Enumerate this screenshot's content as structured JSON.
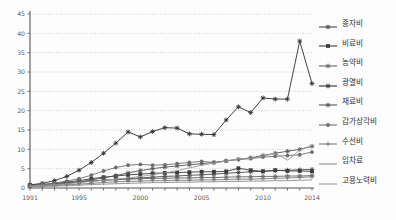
{
  "chart_data": {
    "type": "line",
    "title": "",
    "xlabel": "",
    "ylabel": "",
    "ylim": [
      0,
      45
    ],
    "xlim": [
      1991,
      2014
    ],
    "grid": true,
    "legend_position": "right",
    "y_ticks": [
      0,
      5,
      10,
      15,
      20,
      25,
      30,
      35,
      40,
      45
    ],
    "x_ticks": [
      1991,
      1995,
      2000,
      2005,
      2010,
      2014
    ],
    "x": [
      1991,
      1992,
      1993,
      1994,
      1995,
      1996,
      1997,
      1998,
      1999,
      2000,
      2001,
      2002,
      2003,
      2004,
      2005,
      2006,
      2007,
      2008,
      2009,
      2010,
      2011,
      2012,
      2013,
      2014
    ],
    "series": [
      {
        "name": "종자비",
        "marker": "plus-star",
        "color": "#4a4a4a",
        "values": [
          0.7,
          0.9,
          1.1,
          1.3,
          1.5,
          1.8,
          2.0,
          2.2,
          2.4,
          2.6,
          2.8,
          3.0,
          3.1,
          3.3,
          3.4,
          3.6,
          3.8,
          4.0,
          4.2,
          4.3,
          4.5,
          4.6,
          4.7,
          4.8
        ]
      },
      {
        "name": "비료비",
        "marker": "square",
        "color": "#3b3b3b",
        "values": [
          0.6,
          0.8,
          1.1,
          1.5,
          1.9,
          2.4,
          2.8,
          3.1,
          3.4,
          3.6,
          3.8,
          3.9,
          4.0,
          4.1,
          4.2,
          4.2,
          4.3,
          5.1,
          4.6,
          4.3,
          4.6,
          4.4,
          4.4,
          4.3
        ]
      },
      {
        "name": "농약비",
        "marker": "star",
        "color": "#646464",
        "values": [
          0.5,
          0.7,
          0.9,
          1.2,
          1.5,
          1.8,
          2.0,
          2.2,
          2.3,
          2.4,
          2.5,
          2.5,
          2.6,
          2.6,
          2.7,
          2.7,
          2.8,
          2.9,
          2.9,
          3.0,
          3.0,
          3.1,
          3.1,
          3.2
        ]
      },
      {
        "name": "광열비",
        "marker": "asterisk",
        "color": "#2e2e2e",
        "values": [
          0.8,
          1.2,
          1.9,
          3.0,
          4.6,
          6.6,
          9.0,
          11.6,
          14.5,
          13.2,
          14.6,
          15.6,
          15.5,
          14.0,
          13.9,
          13.8,
          17.6,
          21.0,
          19.5,
          23.3,
          23.0,
          23.0,
          38.0,
          27.0
        ]
      },
      {
        "name": "재료비",
        "marker": "star",
        "color": "#565656",
        "values": [
          0.5,
          0.7,
          0.9,
          1.2,
          1.6,
          2.1,
          2.6,
          3.2,
          3.9,
          4.5,
          5.0,
          5.4,
          5.7,
          6.0,
          6.3,
          6.6,
          7.0,
          7.4,
          7.8,
          8.4,
          9.0,
          9.5,
          10.0,
          10.8
        ]
      },
      {
        "name": "감가상각비",
        "marker": "circle",
        "color": "#6e6e6e",
        "values": [
          0.6,
          0.9,
          1.3,
          1.8,
          2.4,
          3.3,
          4.4,
          5.3,
          5.9,
          6.1,
          5.9,
          6.0,
          6.3,
          6.6,
          6.9,
          6.6,
          7.0,
          7.4,
          7.6,
          8.0,
          8.2,
          8.4,
          8.6,
          9.3
        ]
      },
      {
        "name": "수선비",
        "marker": "plus",
        "color": "#7a7a7a",
        "values": [
          0.4,
          0.5,
          0.6,
          0.8,
          1.0,
          1.2,
          1.4,
          1.6,
          1.7,
          1.8,
          1.9,
          1.9,
          2.0,
          2.0,
          2.1,
          2.1,
          2.2,
          2.3,
          2.3,
          2.4,
          2.5,
          2.6,
          2.7,
          2.9
        ]
      },
      {
        "name": "임차료",
        "marker": "none",
        "color": "#8c8c8c",
        "values": [
          0.3,
          0.4,
          0.5,
          0.6,
          0.7,
          0.9,
          1.0,
          1.1,
          1.2,
          1.3,
          1.4,
          1.4,
          1.5,
          1.5,
          1.6,
          1.6,
          1.7,
          1.7,
          1.8,
          1.8,
          1.9,
          1.9,
          2.0,
          2.1
        ]
      },
      {
        "name": "고용노력비",
        "marker": "none",
        "color": "#9a9a9a",
        "values": [
          0.5,
          0.7,
          0.9,
          1.1,
          1.4,
          1.7,
          2.0,
          2.3,
          2.6,
          3.0,
          3.4,
          3.9,
          4.5,
          5.2,
          5.9,
          6.4,
          7.0,
          7.5,
          7.6,
          8.2,
          9.0,
          7.2,
          9.8,
          11.0
        ]
      }
    ]
  }
}
